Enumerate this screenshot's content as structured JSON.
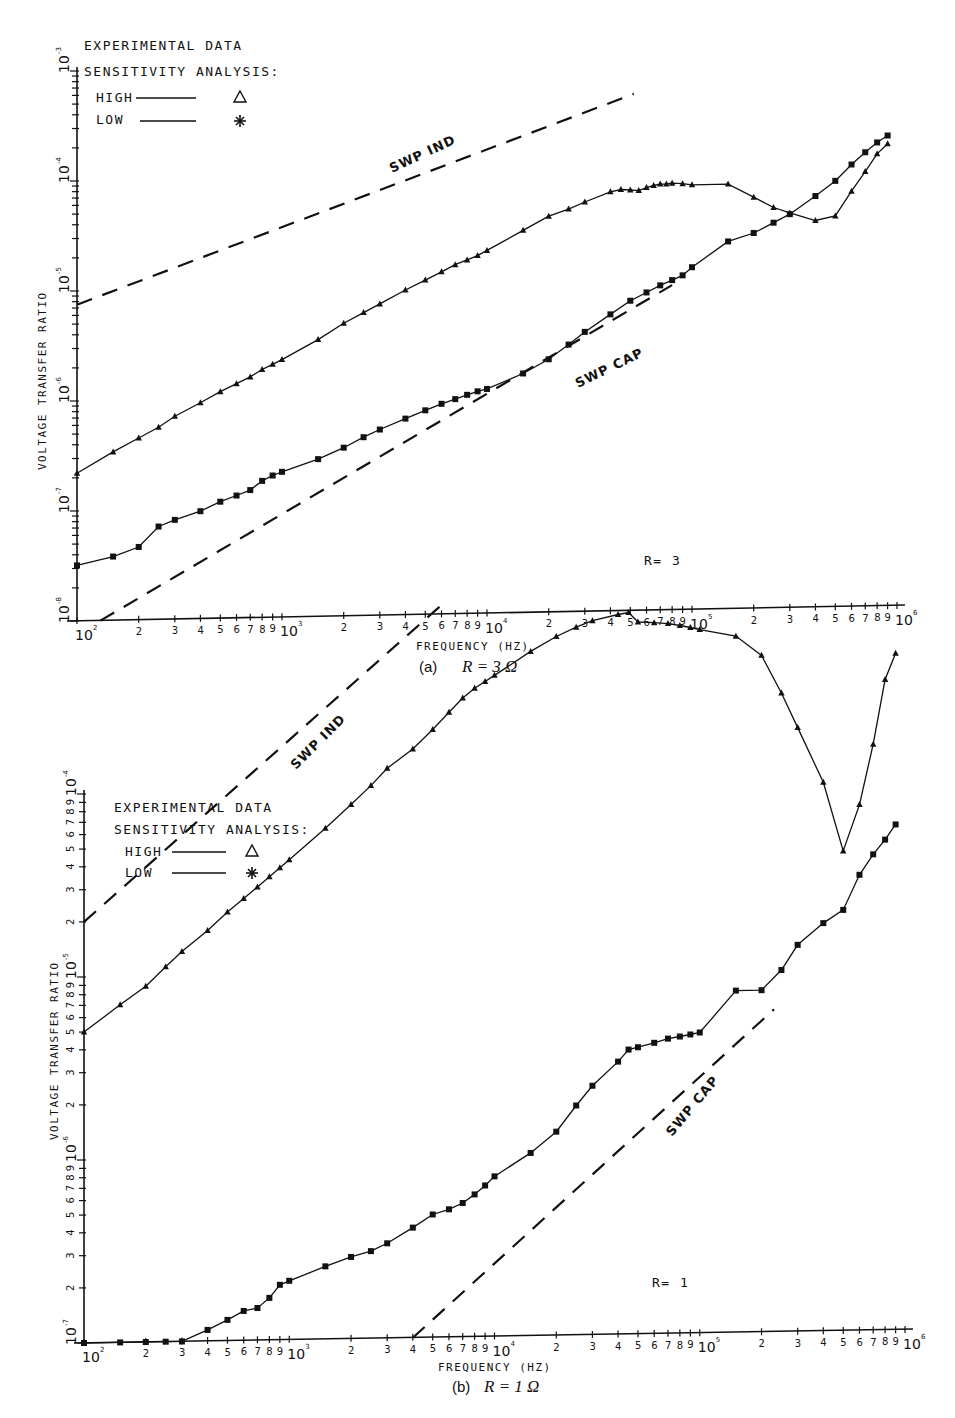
{
  "figure": {
    "panels": [
      {
        "id": "a",
        "caption_prefix": "(a)",
        "caption_math": "R = 3 Ω",
        "annotation": "R=  3",
        "xlabel": "FREQUENCY  (HZ)",
        "ylabel": "VOLTAGE TRANSFER RATIO",
        "legend": {
          "line1": "EXPERIMENTAL DATA",
          "line2": "SENSITIVITY ANALYSIS:",
          "high_label": "HIGH",
          "low_label": "LOW",
          "high_marker": "triangle",
          "low_marker": "asterisk"
        },
        "dashed_labels": {
          "ind": "SWP IND",
          "cap": "SWP CAP"
        }
      },
      {
        "id": "b",
        "caption_prefix": "(b)",
        "caption_math": "R = 1 Ω",
        "annotation": "R=  1",
        "xlabel": "FREQUENCY  (HZ)",
        "ylabel": "VOLTAGE TRANSFER RATIO",
        "legend": {
          "line1": "EXPERIMENTAL DATA",
          "line2": "SENSITIVITY ANALYSIS:",
          "high_label": "HIGH",
          "low_label": "LOW",
          "high_marker": "triangle",
          "low_marker": "asterisk"
        },
        "dashed_labels": {
          "ind": "SWP IND",
          "cap": "SWP CAP"
        }
      }
    ]
  },
  "chart_data": [
    {
      "type": "line",
      "title": "(a) R = 3 Ω",
      "xlabel": "FREQUENCY (HZ)",
      "ylabel": "VOLTAGE TRANSFER RATIO",
      "xscale": "log",
      "yscale": "log",
      "xlim": [
        100,
        1000000
      ],
      "ylim": [
        1e-08,
        0.001
      ],
      "x_ticks": [
        "10^2",
        "2",
        "3",
        "4",
        "5",
        "6",
        "7",
        "8",
        "9",
        "10^3",
        "2",
        "3",
        "4",
        "5",
        "6",
        "7",
        "8",
        "9",
        "10^4",
        "2",
        "3",
        "4",
        "5",
        "6",
        "7",
        "8",
        "9",
        "10^5",
        "2",
        "3",
        "4",
        "5",
        "6",
        "7",
        "8",
        "9",
        "10^6"
      ],
      "y_ticks": [
        "10^-8",
        "10^-7",
        "10^-6",
        "10^-5",
        "10^-4",
        "10^-3"
      ],
      "annotation": "R= 3",
      "legend": [
        "EXPERIMENTAL DATA",
        "SENSITIVITY ANALYSIS: HIGH (triangle)",
        "SENSITIVITY ANALYSIS: LOW (asterisk)"
      ],
      "series": [
        {
          "name": "HIGH (triangle)",
          "x": [
            100,
            150,
            200,
            250,
            300,
            400,
            500,
            600,
            700,
            800,
            900,
            1000,
            1500,
            2000,
            2500,
            3000,
            4000,
            5000,
            6000,
            7000,
            8000,
            9000,
            10000,
            15000,
            20000,
            25000,
            30000,
            40000,
            45000,
            50000,
            55000,
            60000,
            65000,
            70000,
            75000,
            80000,
            90000,
            100000,
            150000,
            200000,
            250000,
            300000,
            400000,
            500000,
            600000,
            700000,
            800000,
            900000
          ],
          "y": [
            2.2e-07,
            3.4e-07,
            4.5e-07,
            5.6e-07,
            7e-07,
            9.2e-07,
            1.15e-06,
            1.35e-06,
            1.55e-06,
            1.8e-06,
            2e-06,
            2.2e-06,
            3.3e-06,
            4.6e-06,
            5.7e-06,
            6.8e-06,
            9e-06,
            1.1e-05,
            1.3e-05,
            1.5e-05,
            1.65e-05,
            1.8e-05,
            2e-05,
            3e-05,
            4e-05,
            4.6e-05,
            5.3e-05,
            6.5e-05,
            6.8e-05,
            6.7e-05,
            6.6e-05,
            7e-05,
            7.3e-05,
            7.5e-05,
            7.5e-05,
            7.6e-05,
            7.5e-05,
            7.3e-05,
            7.3e-05,
            5.5e-05,
            4.4e-05,
            3.9e-05,
            3.3e-05,
            3.6e-05,
            6e-05,
            9e-05,
            0.00013,
            0.00016
          ]
        },
        {
          "name": "LOW (asterisk)",
          "x": [
            100,
            150,
            200,
            250,
            300,
            400,
            500,
            600,
            700,
            800,
            900,
            1000,
            1500,
            2000,
            2500,
            3000,
            4000,
            5000,
            6000,
            7000,
            8000,
            9000,
            10000,
            15000,
            20000,
            25000,
            30000,
            40000,
            50000,
            60000,
            70000,
            80000,
            90000,
            100000,
            150000,
            200000,
            250000,
            300000,
            400000,
            500000,
            600000,
            700000,
            800000,
            900000
          ],
          "y": [
            3.2e-08,
            3.8e-08,
            4.6e-08,
            7e-08,
            8e-08,
            9.5e-08,
            1.15e-07,
            1.3e-07,
            1.45e-07,
            1.75e-07,
            1.95e-07,
            2.1e-07,
            2.7e-07,
            3.4e-07,
            4.2e-07,
            4.9e-07,
            6.1e-07,
            7.2e-07,
            8.2e-07,
            9e-07,
            9.8e-07,
            1.05e-06,
            1.1e-06,
            1.5e-06,
            2e-06,
            2.7e-06,
            3.5e-06,
            5e-06,
            6.6e-06,
            7.8e-06,
            9e-06,
            1e-05,
            1.1e-05,
            1.3e-05,
            2.2e-05,
            2.6e-05,
            3.2e-05,
            3.8e-05,
            5.5e-05,
            7.5e-05,
            0.000105,
            0.000135,
            0.000165,
            0.00019
          ]
        },
        {
          "name": "SWP IND (dashed)",
          "x": [
            100,
            52000
          ],
          "y": [
            7.5e-06,
            0.0005
          ]
        },
        {
          "name": "SWP CAP (dashed)",
          "x": [
            130,
            80000
          ],
          "y": [
            1e-08,
            9e-06
          ]
        }
      ]
    },
    {
      "type": "line",
      "title": "(b) R = 1 Ω",
      "xlabel": "FREQUENCY (HZ)",
      "ylabel": "VOLTAGE TRANSFER RATIO",
      "xscale": "log",
      "yscale": "log",
      "xlim": [
        100,
        1000000
      ],
      "ylim": [
        1e-07,
        0.0001
      ],
      "x_ticks": [
        "10^2",
        "2",
        "3",
        "4",
        "5",
        "6",
        "7",
        "8",
        "9",
        "10^3",
        "2",
        "3",
        "4",
        "5",
        "6",
        "7",
        "8",
        "9",
        "10^4",
        "2",
        "3",
        "4",
        "5",
        "6",
        "7",
        "8",
        "9",
        "10^5",
        "2",
        "3",
        "4",
        "5",
        "6",
        "7",
        "8",
        "9",
        "10^6"
      ],
      "y_ticks": [
        "10^-7",
        "2",
        "3",
        "4",
        "5",
        "6",
        "7",
        "8",
        "9",
        "10^-6",
        "2",
        "3",
        "4",
        "5",
        "6",
        "7",
        "8",
        "9",
        "10^-5",
        "2",
        "3",
        "4",
        "5",
        "6",
        "7",
        "8",
        "9",
        "10^-4"
      ],
      "annotation": "R= 1",
      "legend": [
        "EXPERIMENTAL DATA",
        "SENSITIVITY ANALYSIS: HIGH (triangle)",
        "SENSITIVITY ANALYSIS: LOW (asterisk)"
      ],
      "series": [
        {
          "name": "HIGH (triangle)",
          "x": [
            100,
            150,
            200,
            250,
            300,
            400,
            500,
            600,
            700,
            800,
            900,
            1000,
            1500,
            2000,
            2500,
            3000,
            4000,
            5000,
            6000,
            7000,
            8000,
            9000,
            10000,
            15000,
            20000,
            25000,
            30000,
            40000,
            45000,
            50000,
            60000,
            70000,
            80000,
            90000,
            100000,
            150000,
            200000,
            250000,
            300000,
            400000,
            500000,
            600000,
            700000,
            800000,
            900000
          ],
          "y": [
            5e-06,
            7e-06,
            8.8e-06,
            1.12e-05,
            1.35e-05,
            1.75e-05,
            2.2e-05,
            2.6e-05,
            3e-05,
            3.4e-05,
            3.8e-05,
            4.2e-05,
            6.2e-05,
            8.3e-05,
            0.000105,
            0.00013,
            0.000165,
            0.00021,
            0.00026,
            0.00031,
            0.00035,
            0.00038,
            0.00041,
            0.00055,
            0.00066,
            0.00074,
            0.0008,
            0.00086,
            0.00088,
            0.00078,
            0.00077,
            0.00076,
            0.00074,
            0.00072,
            0.0007,
            0.00064,
            0.0005,
            0.00031,
            0.0002,
            0.0001,
            4.2e-05,
            7.5e-05,
            0.00016,
            0.00036,
            0.0005
          ]
        },
        {
          "name": "LOW (asterisk)",
          "x": [
            100,
            150,
            200,
            250,
            300,
            400,
            500,
            600,
            700,
            800,
            900,
            1000,
            1500,
            2000,
            2500,
            3000,
            4000,
            5000,
            6000,
            7000,
            8000,
            9000,
            10000,
            15000,
            20000,
            25000,
            30000,
            40000,
            45000,
            50000,
            60000,
            70000,
            80000,
            90000,
            100000,
            150000,
            200000,
            250000,
            300000,
            400000,
            500000,
            600000,
            700000,
            800000,
            900000
          ],
          "y": [
            1e-07,
            1e-07,
            1e-07,
            1e-07,
            1e-07,
            1.15e-07,
            1.3e-07,
            1.45e-07,
            1.5e-07,
            1.7e-07,
            2e-07,
            2.1e-07,
            2.5e-07,
            2.8e-07,
            3e-07,
            3.3e-07,
            4e-07,
            4.7e-07,
            5e-07,
            5.4e-07,
            6e-07,
            6.7e-07,
            7.5e-07,
            1e-06,
            1.3e-06,
            1.8e-06,
            2.3e-06,
            3.1e-06,
            3.6e-06,
            3.7e-06,
            3.9e-06,
            4.1e-06,
            4.2e-06,
            4.3e-06,
            4.4e-06,
            7.4e-06,
            7.4e-06,
            9.5e-06,
            1.3e-05,
            1.7e-05,
            2e-05,
            3.1e-05,
            4e-05,
            4.8e-05,
            5.8e-05
          ]
        },
        {
          "name": "SWP IND (dashed)",
          "x": [
            100,
            5500
          ],
          "y": [
            2e-05,
            0.001
          ]
        },
        {
          "name": "SWP CAP (dashed)",
          "x": [
            4000,
            230000
          ],
          "y": [
            1e-07,
            5.8e-06
          ]
        }
      ]
    }
  ]
}
